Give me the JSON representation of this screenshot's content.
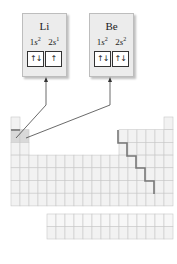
{
  "elements": [
    {
      "symbol": "Li",
      "orbitals": [
        {
          "n": "1",
          "l": "s",
          "electrons": "2",
          "arrows": "↑↓"
        },
        {
          "n": "2",
          "l": "s",
          "electrons": "1",
          "arrows": "↑"
        }
      ]
    },
    {
      "symbol": "Be",
      "orbitals": [
        {
          "n": "1",
          "l": "s",
          "electrons": "2",
          "arrows": "↑↓"
        },
        {
          "n": "2",
          "l": "s",
          "electrons": "2",
          "arrows": "↑↓"
        }
      ]
    }
  ],
  "colors": {
    "box_bg": "#ececec",
    "cell_fill": "#f2f2f2",
    "cell_line": "#c8c8c8",
    "highlight_fill": "#d9d9d9",
    "staircase": "#777777",
    "arrow": "#444444"
  },
  "table": {
    "rows": 7,
    "columns": 18,
    "highlighted": [
      "Li",
      "Be"
    ]
  }
}
